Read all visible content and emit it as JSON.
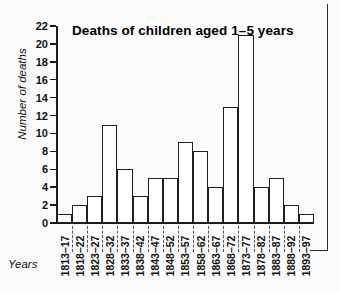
{
  "chart_data": {
    "type": "bar",
    "title": "Deaths of children aged 1–5 years",
    "xlabel": "Years",
    "ylabel": "Number of deaths",
    "ylim": [
      0,
      22
    ],
    "ytick_step": 2,
    "yticks": [
      0,
      2,
      4,
      6,
      8,
      10,
      12,
      14,
      16,
      18,
      20,
      22
    ],
    "grid": false,
    "legend": null,
    "categories": [
      "1813–17",
      "1818–22",
      "1823–27",
      "1828–32",
      "1833–37",
      "1838–42",
      "1843–47",
      "1848–52",
      "1853–57",
      "1858–62",
      "1863–67",
      "1868–72",
      "1873–77",
      "1878–82",
      "1883–87",
      "1888–92",
      "1893–97"
    ],
    "values": [
      1,
      2,
      3,
      11,
      6,
      3,
      5,
      5,
      9,
      8,
      4,
      13,
      21,
      4,
      5,
      2,
      1
    ],
    "bar_style": {
      "fill": "#ffffff",
      "edge": "#1f1f1f",
      "edge_width_px": 1.6
    }
  }
}
